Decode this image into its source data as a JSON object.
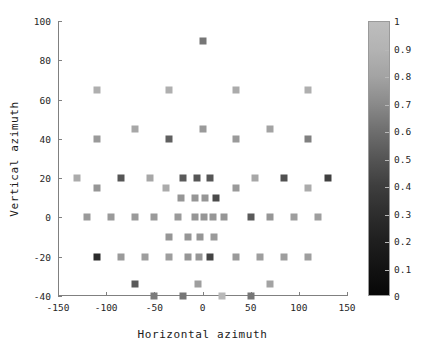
{
  "chart_data": {
    "type": "scatter",
    "title": "",
    "xlabel": "Horizontal azimuth",
    "ylabel": "Vertical azimuth",
    "xlim": [
      -150,
      150
    ],
    "ylim": [
      -40,
      100
    ],
    "xticks": [
      -150,
      -100,
      -50,
      0,
      50,
      100,
      150
    ],
    "yticks": [
      -40,
      -20,
      0,
      20,
      40,
      60,
      80,
      100
    ],
    "grid": false,
    "colormap": "gray",
    "colorbar": {
      "position": "right",
      "min": 0,
      "max": 1,
      "ticks": [
        0,
        0.1,
        0.2,
        0.3,
        0.4,
        0.5,
        0.6,
        0.7,
        0.8,
        0.9,
        1
      ],
      "ticklabels": [
        "0",
        "0.1",
        "0.2",
        "0.3",
        "0.4",
        "0.5",
        "0.6",
        "0.7",
        "0.8",
        "0.9",
        "1"
      ],
      "low_color": "#070707",
      "high_color": "#bdbdbd"
    },
    "marker": "square",
    "marker_size_px": 7,
    "points": [
      {
        "x": 0,
        "y": 90,
        "c": 0.55
      },
      {
        "x": -110,
        "y": 65,
        "c": 0.82
      },
      {
        "x": -35,
        "y": 65,
        "c": 0.82
      },
      {
        "x": 35,
        "y": 65,
        "c": 0.8
      },
      {
        "x": 110,
        "y": 65,
        "c": 0.82
      },
      {
        "x": -70,
        "y": 45,
        "c": 0.78
      },
      {
        "x": 0,
        "y": 45,
        "c": 0.72
      },
      {
        "x": 70,
        "y": 45,
        "c": 0.76
      },
      {
        "x": -110,
        "y": 40,
        "c": 0.72
      },
      {
        "x": -35,
        "y": 40,
        "c": 0.45
      },
      {
        "x": 35,
        "y": 40,
        "c": 0.72
      },
      {
        "x": 110,
        "y": 40,
        "c": 0.6
      },
      {
        "x": -130,
        "y": 20,
        "c": 0.8
      },
      {
        "x": -85,
        "y": 20,
        "c": 0.4
      },
      {
        "x": -55,
        "y": 20,
        "c": 0.78
      },
      {
        "x": -20,
        "y": 20,
        "c": 0.42
      },
      {
        "x": -6,
        "y": 20,
        "c": 0.4
      },
      {
        "x": 8,
        "y": 20,
        "c": 0.4
      },
      {
        "x": 55,
        "y": 20,
        "c": 0.78
      },
      {
        "x": 85,
        "y": 20,
        "c": 0.38
      },
      {
        "x": 130,
        "y": 20,
        "c": 0.3
      },
      {
        "x": -110,
        "y": 15,
        "c": 0.7
      },
      {
        "x": -38,
        "y": 15,
        "c": 0.8
      },
      {
        "x": 35,
        "y": 15,
        "c": 0.72
      },
      {
        "x": 110,
        "y": 15,
        "c": 0.8
      },
      {
        "x": -22,
        "y": 10,
        "c": 0.7
      },
      {
        "x": -8,
        "y": 10,
        "c": 0.7
      },
      {
        "x": 3,
        "y": 10,
        "c": 0.7
      },
      {
        "x": 14,
        "y": 10,
        "c": 0.35
      },
      {
        "x": -120,
        "y": 0,
        "c": 0.72
      },
      {
        "x": -95,
        "y": 0,
        "c": 0.72
      },
      {
        "x": -70,
        "y": 0,
        "c": 0.72
      },
      {
        "x": -50,
        "y": 0,
        "c": 0.72
      },
      {
        "x": -25,
        "y": 0,
        "c": 0.72
      },
      {
        "x": -8,
        "y": 0,
        "c": 0.7
      },
      {
        "x": 2,
        "y": 0,
        "c": 0.7
      },
      {
        "x": 11,
        "y": 0,
        "c": 0.7
      },
      {
        "x": 22,
        "y": 0,
        "c": 0.7
      },
      {
        "x": 50,
        "y": 0,
        "c": 0.42
      },
      {
        "x": 70,
        "y": 0,
        "c": 0.7
      },
      {
        "x": 95,
        "y": 0,
        "c": 0.74
      },
      {
        "x": 120,
        "y": 0,
        "c": 0.74
      },
      {
        "x": -35,
        "y": -10,
        "c": 0.7
      },
      {
        "x": -15,
        "y": -10,
        "c": 0.7
      },
      {
        "x": -3,
        "y": -10,
        "c": 0.7
      },
      {
        "x": 12,
        "y": -10,
        "c": 0.72
      },
      {
        "x": -110,
        "y": -20,
        "c": 0.2
      },
      {
        "x": -85,
        "y": -20,
        "c": 0.72
      },
      {
        "x": -60,
        "y": -20,
        "c": 0.74
      },
      {
        "x": -35,
        "y": -20,
        "c": 0.74
      },
      {
        "x": -15,
        "y": -20,
        "c": 0.7
      },
      {
        "x": -4,
        "y": -20,
        "c": 0.7
      },
      {
        "x": 8,
        "y": -20,
        "c": 0.32
      },
      {
        "x": 35,
        "y": -20,
        "c": 0.72
      },
      {
        "x": 60,
        "y": -20,
        "c": 0.74
      },
      {
        "x": 85,
        "y": -20,
        "c": 0.74
      },
      {
        "x": 110,
        "y": -20,
        "c": 0.74
      },
      {
        "x": -70,
        "y": -34,
        "c": 0.42
      },
      {
        "x": -5,
        "y": -34,
        "c": 0.74
      },
      {
        "x": 70,
        "y": -34,
        "c": 0.76
      },
      {
        "x": -50,
        "y": -40,
        "c": 0.58
      },
      {
        "x": -20,
        "y": -40,
        "c": 0.55
      },
      {
        "x": 20,
        "y": -40,
        "c": 0.86
      },
      {
        "x": 50,
        "y": -40,
        "c": 0.55
      }
    ]
  }
}
